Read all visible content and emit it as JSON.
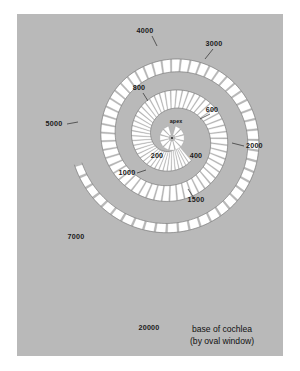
{
  "figure": {
    "background_color": "#ffffff",
    "panel_color": "#b9b9b9",
    "segment_color": "#ffffff",
    "line_color": "#2b2b2b",
    "text_color": "#1a1a1a"
  },
  "caption": {
    "line1": "base of cochlea",
    "line2": "(by oval window)"
  },
  "apex": {
    "label": "apex"
  },
  "chart_data": {
    "type": "diagram",
    "xlabel": "",
    "ylabel": "",
    "units": "Hz",
    "categories": [
      "200",
      "400",
      "600",
      "800",
      "1000",
      "1500",
      "2000",
      "3000",
      "4000",
      "5000",
      "7000",
      "20000"
    ],
    "values": [
      200,
      400,
      600,
      800,
      1000,
      1500,
      2000,
      3000,
      4000,
      5000,
      7000,
      20000
    ],
    "annotations": [
      "apex",
      "base of cochlea",
      "(by oval window)"
    ]
  },
  "frequency_labels": [
    {
      "text": "4000",
      "x": 145,
      "y": 33,
      "anchor": "middle",
      "leader": "M152,36 L157,46"
    },
    {
      "text": "3000",
      "x": 214,
      "y": 46,
      "anchor": "middle",
      "leader": "M213,49 L205,59"
    },
    {
      "text": "2000",
      "x": 246,
      "y": 148,
      "anchor": "start",
      "leader": "M244,146 L232,143"
    },
    {
      "text": "1500",
      "x": 196,
      "y": 202,
      "anchor": "middle",
      "leader": "M194,198 L188,189"
    },
    {
      "text": "1000",
      "x": 127,
      "y": 175,
      "anchor": "middle",
      "leader": "M137,173 L146,170"
    },
    {
      "text": "800",
      "x": 139,
      "y": 90,
      "anchor": "middle",
      "leader": "M143,93 L148,101"
    },
    {
      "text": "600",
      "x": 212,
      "y": 112,
      "anchor": "middle",
      "leader": "M210,114 L200,119"
    },
    {
      "text": "400",
      "x": 196,
      "y": 158,
      "anchor": "middle",
      "leader": ""
    },
    {
      "text": "200",
      "x": 157,
      "y": 158,
      "anchor": "middle",
      "leader": ""
    },
    {
      "text": "5000",
      "x": 54,
      "y": 126,
      "anchor": "middle",
      "leader": "M67,124 L78,122"
    },
    {
      "text": "7000",
      "x": 76,
      "y": 239,
      "anchor": "middle",
      "leader": ""
    },
    {
      "text": "20000",
      "x": 149,
      "y": 330,
      "anchor": "middle",
      "leader": ""
    }
  ]
}
